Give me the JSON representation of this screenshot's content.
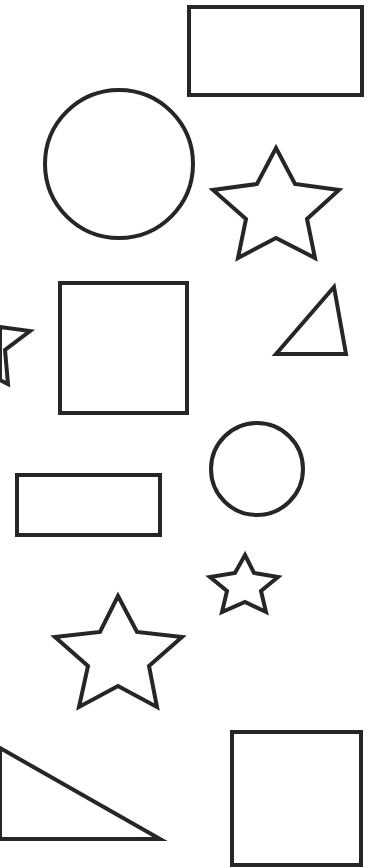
{
  "canvas": {
    "width": 383,
    "height": 868,
    "background": "#ffffff",
    "stroke_color": "#262626",
    "stroke_width": 4
  },
  "shapes": [
    {
      "type": "rectangle",
      "label": "rectangle",
      "x": 189,
      "y": 7,
      "w": 173,
      "h": 88
    },
    {
      "type": "circle",
      "label": "circle",
      "cx": 119,
      "cy": 164,
      "r": 74
    },
    {
      "type": "star",
      "label": "star",
      "points": "276,148 295,184 339,190 307,219 315,258 276,238 238,258 246,219 213,190 257,184"
    },
    {
      "type": "star",
      "label": "star-partial",
      "points": "0,327 30,331 5,350 8,384 0,380"
    },
    {
      "type": "rectangle",
      "label": "square",
      "x": 60,
      "y": 283,
      "w": 127,
      "h": 130
    },
    {
      "type": "triangle",
      "label": "triangle",
      "points": "276,354 334,287 346,354"
    },
    {
      "type": "circle",
      "label": "circle-small",
      "cx": 257,
      "cy": 469,
      "r": 46
    },
    {
      "type": "rectangle",
      "label": "rectangle-wide",
      "x": 17,
      "y": 475,
      "w": 143,
      "h": 60
    },
    {
      "type": "star",
      "label": "star-small",
      "points": "245,555 254,573 278,577 261,591 266,612 245,602 222,612 227,591 210,577 235,573"
    },
    {
      "type": "star",
      "label": "star-medium",
      "points": "118,596 137,632 182,637 149,666 157,707 118,686 79,707 88,666 55,637 100,632"
    },
    {
      "type": "triangle",
      "label": "triangle-right",
      "points": "0,748 160,839 0,839"
    },
    {
      "type": "rectangle",
      "label": "square-bottom",
      "x": 232,
      "y": 732,
      "w": 129,
      "h": 133
    }
  ]
}
